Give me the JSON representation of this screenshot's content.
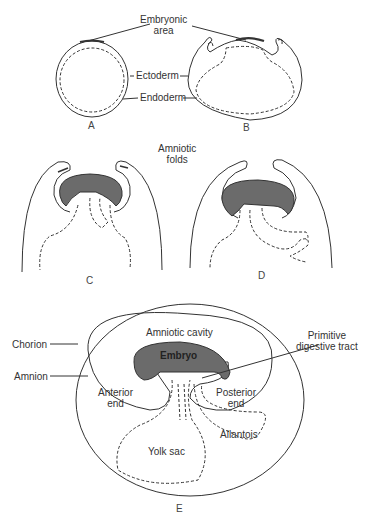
{
  "figure": {
    "colors": {
      "line": "#333333",
      "embryo_fill": "#6b6b6b",
      "background": "#ffffff"
    },
    "panels": [
      "A",
      "B",
      "C",
      "D",
      "E"
    ],
    "labels": {
      "embryonic_area_1": "Embryonic",
      "embryonic_area_2": "area",
      "ectoderm": "Ectoderm",
      "endoderm": "Endoderm",
      "amniotic_folds_1": "Amniotic",
      "amniotic_folds_2": "folds",
      "chorion": "Chorion",
      "amnion": "Amnion",
      "amniotic_cavity": "Amniotic cavity",
      "primitive_tract_1": "Primitive",
      "primitive_tract_2": "digestive tract",
      "embryo": "Embryo",
      "anterior_end_1": "Anterior",
      "anterior_end_2": "end",
      "posterior_end_1": "Posterior",
      "posterior_end_2": "end",
      "allantois": "Allantois",
      "yolk_sac": "Yolk sac"
    }
  }
}
